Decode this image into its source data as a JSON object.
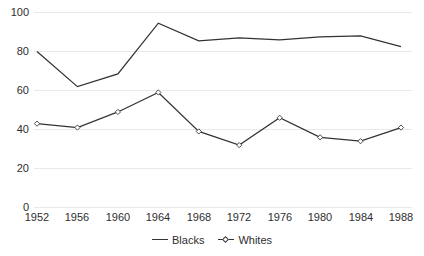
{
  "chart_data": {
    "type": "line",
    "title": "",
    "subtitle": "",
    "xlabel": "",
    "ylabel": "",
    "categories": [
      "1952",
      "1956",
      "1960",
      "1964",
      "1968",
      "1972",
      "1976",
      "1980",
      "1984",
      "1988"
    ],
    "x": [
      1952,
      1956,
      1960,
      1964,
      1968,
      1972,
      1976,
      1980,
      1984,
      1988
    ],
    "series": [
      {
        "name": "Blacks",
        "marker": "none",
        "values": [
          80,
          62,
          68.5,
          94.5,
          85.5,
          87,
          86,
          87.5,
          88,
          82.5
        ]
      },
      {
        "name": "Whites",
        "marker": "diamond",
        "values": [
          43,
          41,
          49,
          59,
          39,
          32,
          46,
          36,
          34,
          41
        ]
      }
    ],
    "ylim": [
      0,
      100
    ],
    "yticks": [
      0,
      20,
      40,
      60,
      80,
      100
    ],
    "ytick_labels": [
      "0",
      "20",
      "40",
      "60",
      "80",
      "100"
    ],
    "xtick_labels": [
      "1952",
      "1956",
      "1960",
      "1964",
      "1968",
      "1972",
      "1976",
      "1980",
      "1984",
      "1988"
    ],
    "grid": true,
    "grid_axis": "y",
    "legend_position": "bottom-center",
    "legend_entries": [
      "Blacks",
      "Whites"
    ],
    "line_color": "#333333",
    "grid_color": "#e9e9ec",
    "text_color": "#2e2e2e",
    "background": "#ffffff"
  },
  "legend": {
    "blacks_label": "Blacks",
    "whites_label": "Whites"
  },
  "caption": {
    "text": ""
  }
}
